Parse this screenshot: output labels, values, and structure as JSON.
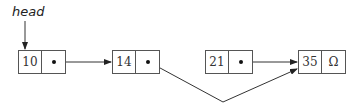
{
  "diagram": {
    "type": "linked-list",
    "head_label": "head",
    "nodes": [
      {
        "value": "10",
        "next": "pointer",
        "points_to": "14"
      },
      {
        "value": "14",
        "next": "pointer",
        "points_to": "35"
      },
      {
        "value": "21",
        "next": "pointer",
        "points_to": "35"
      },
      {
        "value": "35",
        "next": "Ω"
      }
    ],
    "colors": {
      "stroke": "#555555",
      "text": "#333333",
      "background": "#ffffff"
    }
  }
}
